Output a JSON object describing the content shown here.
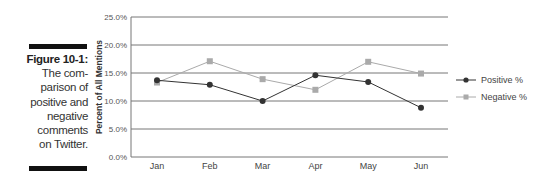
{
  "caption": {
    "figure_label": "Figure 10-1:",
    "text_lines": [
      "The com-",
      "parison of",
      "positive and",
      "negative",
      "comments",
      "on Twitter."
    ]
  },
  "chart_data": {
    "type": "line",
    "title": "",
    "xlabel": "",
    "ylabel": "Percent of All Mentions",
    "categories": [
      "Jan",
      "Feb",
      "Mar",
      "Apr",
      "May",
      "Jun"
    ],
    "series": [
      {
        "name": "Positive %",
        "marker": "circle",
        "color": "#333333",
        "values": [
          13.7,
          12.9,
          10.0,
          14.6,
          13.4,
          8.8
        ]
      },
      {
        "name": "Negative %",
        "marker": "square",
        "color": "#aaaaaa",
        "values": [
          13.3,
          17.1,
          13.9,
          12.0,
          17.0,
          14.9
        ]
      }
    ],
    "ylim": [
      0,
      25
    ],
    "yticks": [
      "0.0%",
      "5.0%",
      "10.0%",
      "15.0%",
      "20.0%",
      "25.0%"
    ],
    "grid": true,
    "legend_position": "right"
  }
}
